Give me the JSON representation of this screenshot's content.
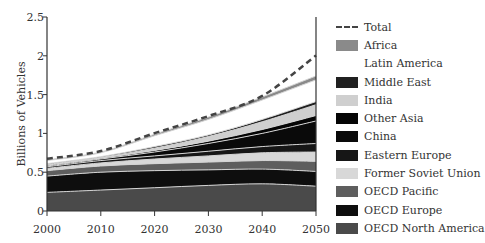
{
  "chart_data": {
    "type": "area",
    "stacked": true,
    "title": "",
    "xlabel": "",
    "ylabel": "Billions of Vehicles",
    "x": [
      2000,
      2010,
      2020,
      2030,
      2040,
      2050
    ],
    "xlim": [
      2000,
      2050
    ],
    "ylim": [
      0,
      2.5
    ],
    "x_ticks": [
      "2000",
      "2010",
      "2020",
      "2030",
      "2040",
      "2050"
    ],
    "y_ticks": [
      "0",
      "0.5",
      "1",
      "1.5",
      "2",
      "2.5"
    ],
    "grid": false,
    "legend_position": "right",
    "series": [
      {
        "name": "OECD North America",
        "color": "#4a4a4a",
        "values": [
          0.24,
          0.27,
          0.3,
          0.33,
          0.35,
          0.32
        ]
      },
      {
        "name": "OECD Europe",
        "color": "#0e0e0e",
        "values": [
          0.21,
          0.23,
          0.22,
          0.2,
          0.19,
          0.19
        ]
      },
      {
        "name": "OECD Pacific",
        "color": "#5e5e5e",
        "values": [
          0.07,
          0.08,
          0.09,
          0.1,
          0.11,
          0.13
        ]
      },
      {
        "name": "Former Soviet Union",
        "color": "#d8d8d8",
        "values": [
          0.03,
          0.04,
          0.06,
          0.08,
          0.1,
          0.12
        ]
      },
      {
        "name": "Eastern Europe",
        "color": "#161616",
        "values": [
          0.02,
          0.03,
          0.04,
          0.06,
          0.08,
          0.11
        ]
      },
      {
        "name": "China",
        "color": "#0a0a0a",
        "values": [
          0.01,
          0.02,
          0.05,
          0.1,
          0.17,
          0.29
        ]
      },
      {
        "name": "Other Asia",
        "color": "#050505",
        "values": [
          0.01,
          0.01,
          0.02,
          0.03,
          0.05,
          0.07
        ]
      },
      {
        "name": "India",
        "color": "#cfcfcf",
        "values": [
          0.01,
          0.01,
          0.03,
          0.06,
          0.1,
          0.14
        ]
      },
      {
        "name": "Middle East",
        "color": "#202020",
        "values": [
          0.01,
          0.01,
          0.02,
          0.02,
          0.03,
          0.04
        ]
      },
      {
        "name": "Latin America",
        "color": "#ffffff",
        "values": [
          0.04,
          0.05,
          0.14,
          0.2,
          0.25,
          0.28
        ]
      },
      {
        "name": "Africa",
        "color": "#8a8a8a",
        "values": [
          0.01,
          0.01,
          0.02,
          0.03,
          0.04,
          0.05
        ]
      }
    ],
    "total": {
      "name": "Total",
      "style": "dashed",
      "values": [
        0.66,
        0.76,
        0.99,
        1.21,
        1.47,
        1.99
      ]
    }
  },
  "legend": {
    "items": [
      {
        "label": "Total",
        "type": "dash",
        "color": "#444444"
      },
      {
        "label": "Africa",
        "color": "#8a8a8a"
      },
      {
        "label": "Latin America",
        "color": "#ffffff"
      },
      {
        "label": "Middle East",
        "color": "#202020"
      },
      {
        "label": "India",
        "color": "#cfcfcf"
      },
      {
        "label": "Other Asia",
        "color": "#050505"
      },
      {
        "label": "China",
        "color": "#0a0a0a"
      },
      {
        "label": "Eastern Europe",
        "color": "#161616"
      },
      {
        "label": "Former Soviet Union",
        "color": "#d8d8d8"
      },
      {
        "label": "OECD Pacific",
        "color": "#5e5e5e"
      },
      {
        "label": "OECD Europe",
        "color": "#0e0e0e"
      },
      {
        "label": "OECD North America",
        "color": "#4a4a4a"
      }
    ]
  }
}
